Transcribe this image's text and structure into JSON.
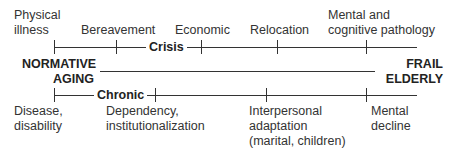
{
  "diagram": {
    "start_label": [
      "NORMATIVE",
      "AGING"
    ],
    "end_label": [
      "FRAIL",
      "ELDERLY"
    ],
    "crisis_track": {
      "label": "Crisis",
      "events": [
        {
          "lines": [
            "Physical",
            "illness"
          ]
        },
        {
          "lines": [
            "Bereavement"
          ]
        },
        {
          "lines": [
            "Economic"
          ]
        },
        {
          "lines": [
            "Relocation"
          ]
        },
        {
          "lines": [
            "Mental and",
            "cognitive pathology"
          ]
        }
      ]
    },
    "chronic_track": {
      "label": "Chronic",
      "events": [
        {
          "lines": [
            "Disease,",
            "disability"
          ]
        },
        {
          "lines": [
            "Dependency,",
            "institutionalization"
          ]
        },
        {
          "lines": [
            "Interpersonal",
            "adaptation",
            "(marital, children)"
          ]
        },
        {
          "lines": [
            "Mental",
            "decline"
          ]
        }
      ]
    }
  }
}
